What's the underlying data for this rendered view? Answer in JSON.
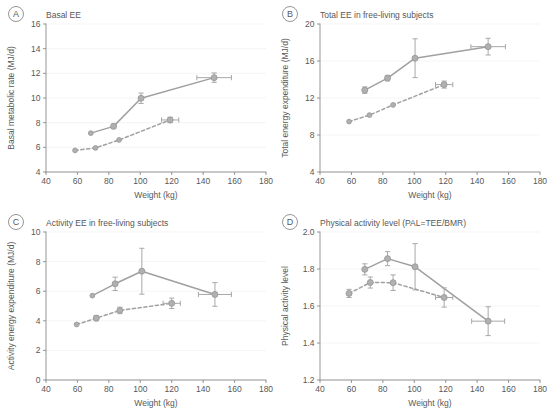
{
  "figure": {
    "x_axis_label": "Weight (kg)",
    "accent_color": "#a0a0a2",
    "marker_color": "#b0b0b2",
    "axis_color": "#8a8a8c",
    "text_color": "#58585a",
    "grid_color": "#f0f0f0",
    "background": "#ffffff"
  },
  "chart_data": [
    {
      "id": "A",
      "panel_letter": "A",
      "type": "line",
      "title": "Basal EE",
      "xlabel": "Weight (kg)",
      "ylabel": "Basal metabolic rate (MJ/d)",
      "xlim": [
        40,
        180
      ],
      "ylim": [
        4,
        16
      ],
      "xticks": [
        40,
        60,
        80,
        100,
        120,
        140,
        160,
        180
      ],
      "yticks": [
        4,
        6,
        8,
        10,
        12,
        14,
        16
      ],
      "grid": "horizontal",
      "legend": "none",
      "series": [
        {
          "name": "solid",
          "style": "solid",
          "points": [
            {
              "x": 68.5,
              "y": 7.15,
              "yerr": 0.0,
              "xerr": 0.0
            },
            {
              "x": 83.0,
              "y": 7.7,
              "yerr": 0.18,
              "xerr": 0.0
            },
            {
              "x": 100.5,
              "y": 9.98,
              "yerr": 0.42,
              "xerr": 0.0
            },
            {
              "x": 147.0,
              "y": 11.65,
              "yerr": 0.38,
              "xerr": 11.0
            }
          ]
        },
        {
          "name": "dashed",
          "style": "dashed",
          "points": [
            {
              "x": 58.5,
              "y": 5.75,
              "yerr": 0.0,
              "xerr": 0.0
            },
            {
              "x": 71.5,
              "y": 5.95,
              "yerr": 0.0,
              "xerr": 0.0
            },
            {
              "x": 86.5,
              "y": 6.6,
              "yerr": 0.0,
              "xerr": 0.0
            },
            {
              "x": 119.0,
              "y": 8.22,
              "yerr": 0.22,
              "xerr": 5.5
            }
          ]
        }
      ]
    },
    {
      "id": "B",
      "panel_letter": "B",
      "type": "line",
      "title": "Total EE in free-living subjects",
      "xlabel": "Weight (kg)",
      "ylabel": "Total energy expenditure (MJ/d)",
      "xlim": [
        40,
        180
      ],
      "ylim": [
        4,
        20
      ],
      "xticks": [
        40,
        60,
        80,
        100,
        120,
        140,
        160,
        180
      ],
      "yticks": [
        4,
        8,
        12,
        16,
        20
      ],
      "grid": "horizontal",
      "legend": "none",
      "series": [
        {
          "name": "solid",
          "style": "solid",
          "points": [
            {
              "x": 68.5,
              "y": 12.85,
              "yerr": 0.35,
              "xerr": 0.0
            },
            {
              "x": 83.0,
              "y": 14.15,
              "yerr": 0.3,
              "xerr": 0.0
            },
            {
              "x": 100.5,
              "y": 16.3,
              "yerr": 2.1,
              "xerr": 0.0
            },
            {
              "x": 147.0,
              "y": 17.55,
              "yerr": 0.9,
              "xerr": 11.0
            }
          ]
        },
        {
          "name": "dashed",
          "style": "dashed",
          "points": [
            {
              "x": 58.5,
              "y": 9.45,
              "yerr": 0.0,
              "xerr": 0.0
            },
            {
              "x": 71.5,
              "y": 10.15,
              "yerr": 0.0,
              "xerr": 0.0
            },
            {
              "x": 86.5,
              "y": 11.25,
              "yerr": 0.0,
              "xerr": 0.0
            },
            {
              "x": 119.0,
              "y": 13.45,
              "yerr": 0.38,
              "xerr": 5.5
            }
          ]
        }
      ]
    },
    {
      "id": "C",
      "panel_letter": "C",
      "type": "line",
      "title": "Activity EE in free-living subjects",
      "xlabel": "Weight (kg)",
      "ylabel": "Activity energy expenditure (MJ/d)",
      "xlim": [
        40,
        180
      ],
      "ylim": [
        0,
        10
      ],
      "xticks": [
        40,
        60,
        80,
        100,
        120,
        140,
        160,
        180
      ],
      "yticks": [
        0,
        2,
        4,
        6,
        8,
        10
      ],
      "grid": "horizontal",
      "legend": "none",
      "series": [
        {
          "name": "solid",
          "style": "solid",
          "points": [
            {
              "x": 69.5,
              "y": 5.7,
              "yerr": 0.0,
              "xerr": 0.0
            },
            {
              "x": 84.0,
              "y": 6.5,
              "yerr": 0.45,
              "xerr": 0.0
            },
            {
              "x": 101.0,
              "y": 7.35,
              "yerr": 1.55,
              "xerr": 0.0
            },
            {
              "x": 147.5,
              "y": 5.78,
              "yerr": 0.8,
              "xerr": 10.5
            }
          ]
        },
        {
          "name": "dashed",
          "style": "dashed",
          "points": [
            {
              "x": 59.5,
              "y": 3.75,
              "yerr": 0.0,
              "xerr": 0.0
            },
            {
              "x": 72.0,
              "y": 4.18,
              "yerr": 0.18,
              "xerr": 0.0
            },
            {
              "x": 87.0,
              "y": 4.7,
              "yerr": 0.22,
              "xerr": 0.0
            },
            {
              "x": 120.0,
              "y": 5.18,
              "yerr": 0.35,
              "xerr": 5.5
            }
          ]
        }
      ]
    },
    {
      "id": "D",
      "panel_letter": "D",
      "type": "line",
      "title": "Physical activity level (PAL=TEE/BMR)",
      "xlabel": "Weight (kg)",
      "ylabel": "Physical activity level",
      "xlim": [
        40,
        180
      ],
      "ylim": [
        1.2,
        2.0
      ],
      "xticks": [
        40,
        60,
        80,
        100,
        120,
        140,
        160,
        180
      ],
      "yticks": [
        1.2,
        1.4,
        1.6,
        1.8,
        2.0
      ],
      "ytick_labels": [
        "1.2",
        "1.4",
        "1.6",
        "1.8",
        "2.0"
      ],
      "grid": "horizontal",
      "legend": "none",
      "series": [
        {
          "name": "solid",
          "style": "solid",
          "points": [
            {
              "x": 68.5,
              "y": 1.798,
              "yerr": 0.03,
              "xerr": 0.0
            },
            {
              "x": 83.0,
              "y": 1.856,
              "yerr": 0.038,
              "xerr": 0.0
            },
            {
              "x": 100.5,
              "y": 1.812,
              "yerr": 0.125,
              "xerr": 0.0
            },
            {
              "x": 147.0,
              "y": 1.518,
              "yerr": 0.078,
              "xerr": 10.5
            }
          ]
        },
        {
          "name": "dashed",
          "style": "dashed",
          "points": [
            {
              "x": 58.5,
              "y": 1.668,
              "yerr": 0.022,
              "xerr": 0.0
            },
            {
              "x": 72.0,
              "y": 1.727,
              "yerr": 0.03,
              "xerr": 0.0
            },
            {
              "x": 86.5,
              "y": 1.726,
              "yerr": 0.042,
              "xerr": 0.0
            },
            {
              "x": 119.0,
              "y": 1.646,
              "yerr": 0.052,
              "xerr": 5.5
            }
          ]
        }
      ]
    }
  ]
}
